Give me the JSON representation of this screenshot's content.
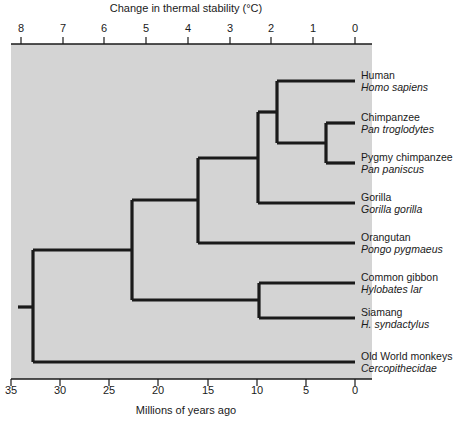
{
  "figure": {
    "background_color": "#d4d4d4",
    "line_color": "#1a1a1a",
    "plot_left_px": 11,
    "plot_right_px": 372,
    "plot_top_px": 44,
    "plot_bottom_px": 379
  },
  "top_axis": {
    "title": "Change in thermal stability (°C)",
    "ticks": [
      {
        "label": "8",
        "x": 21
      },
      {
        "label": "7",
        "x": 63
      },
      {
        "label": "6",
        "x": 104
      },
      {
        "label": "5",
        "x": 146
      },
      {
        "label": "4",
        "x": 188
      },
      {
        "label": "3",
        "x": 230
      },
      {
        "label": "2",
        "x": 271
      },
      {
        "label": "1",
        "x": 313
      },
      {
        "label": "0",
        "x": 355
      }
    ]
  },
  "bottom_axis": {
    "title": "Millions of years ago",
    "ticks": [
      {
        "label": "35",
        "x": 11
      },
      {
        "label": "30",
        "x": 60
      },
      {
        "label": "25",
        "x": 109
      },
      {
        "label": "20",
        "x": 158
      },
      {
        "label": "15",
        "x": 208
      },
      {
        "label": "10",
        "x": 257
      },
      {
        "label": "5",
        "x": 306
      },
      {
        "label": "0",
        "x": 355
      }
    ]
  },
  "chart_data": {
    "type": "tree",
    "top_xlabel": "Change in thermal stability (°C)",
    "bottom_xlabel": "Millions of years ago",
    "top_xlim": [
      8,
      0
    ],
    "bottom_xlim": [
      35,
      0
    ],
    "grid": false,
    "legend": "none",
    "taxa": [
      {
        "common": "Human",
        "scientific": "Homo sapiens",
        "tip_y": 81,
        "branch_start_x": 277
      },
      {
        "common": "Chimpanzee",
        "scientific": "Pan troglodytes",
        "tip_y": 123,
        "branch_start_x": 326
      },
      {
        "common": "Pygmy chimpanzee",
        "scientific": "Pan paniscus",
        "tip_y": 163,
        "branch_start_x": 326
      },
      {
        "common": "Gorilla",
        "scientific": "Gorilla gorilla",
        "tip_y": 203,
        "branch_start_x": 258
      },
      {
        "common": "Orangutan",
        "scientific": "Pongo pygmaeus",
        "tip_y": 243,
        "branch_start_x": 198
      },
      {
        "common": "Common gibbon",
        "scientific": "Hylobates lar",
        "tip_y": 283,
        "branch_start_x": 259
      },
      {
        "common": "Siamang",
        "scientific": "H. syndactylus",
        "tip_y": 318,
        "branch_start_x": 259
      },
      {
        "common": "Old World monkeys",
        "scientific": "Cercopithecidae",
        "tip_y": 362,
        "branch_start_x": 33
      }
    ],
    "nodes": [
      {
        "name": "chimp-pygmy-node",
        "x": 326,
        "mya": 2.5,
        "child_y": [
          123,
          163
        ],
        "parent_y": 143
      },
      {
        "name": "human-pan-node",
        "x": 277,
        "mya": 7.0,
        "child_y": [
          81,
          143
        ],
        "parent_y": 112
      },
      {
        "name": "gorilla-node",
        "x": 258,
        "mya": 9.0,
        "child_y": [
          112,
          203
        ],
        "parent_y": 158
      },
      {
        "name": "orangutan-node",
        "x": 198,
        "mya": 15.0,
        "child_y": [
          158,
          243
        ],
        "parent_y": 200
      },
      {
        "name": "gibbon-siamang-node",
        "x": 259,
        "mya": 9.0,
        "child_y": [
          283,
          318
        ],
        "parent_y": 300
      },
      {
        "name": "hominoid-node",
        "x": 132,
        "mya": 21.5,
        "child_y": [
          200,
          300
        ],
        "parent_y": 250
      },
      {
        "name": "root-node",
        "x": 33,
        "mya": 33.0,
        "child_y": [
          250,
          362
        ],
        "parent_y": 307
      }
    ],
    "root_stub": {
      "x_from": 18,
      "x_to": 33,
      "y": 307
    }
  }
}
